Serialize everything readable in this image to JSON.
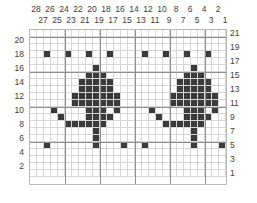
{
  "chart_data": {
    "type": "heatmap",
    "title": "",
    "xlabel": "",
    "ylabel": "",
    "columns": 28,
    "rows": 21,
    "column_labels_even": [
      28,
      26,
      24,
      22,
      20,
      18,
      16,
      14,
      12,
      10,
      8,
      6,
      4,
      2
    ],
    "column_labels_odd": [
      27,
      25,
      23,
      21,
      19,
      17,
      15,
      13,
      11,
      9,
      7,
      5,
      3,
      1
    ],
    "row_labels_left": [
      20,
      18,
      16,
      14,
      12,
      10,
      8,
      6,
      4,
      2
    ],
    "row_labels_right": [
      21,
      19,
      17,
      15,
      13,
      11,
      9,
      7,
      5,
      3,
      1
    ],
    "colors": {
      "filled": "#3b3b3b",
      "empty": "#ffffff",
      "minor_grid": "#d6d6d6",
      "major_grid": "#8e8e8e",
      "text": "#3c3c3c"
    },
    "legend": [],
    "grid": true,
    "filled_cells": [
      {
        "row": 18,
        "cols": [
          3,
          6,
          9,
          12,
          17,
          20,
          23,
          26
        ]
      },
      {
        "row": 16,
        "cols": [
          10,
          24
        ]
      },
      {
        "row": 15,
        "cols": [
          9,
          10,
          11,
          23,
          24,
          25
        ]
      },
      {
        "row": 14,
        "cols": [
          8,
          9,
          10,
          11,
          12,
          22,
          23,
          24,
          25,
          26
        ]
      },
      {
        "row": 13,
        "cols": [
          8,
          9,
          10,
          11,
          12,
          22,
          23,
          24,
          25,
          26
        ]
      },
      {
        "row": 12,
        "cols": [
          7,
          8,
          9,
          10,
          11,
          12,
          13,
          21,
          22,
          23,
          24,
          25,
          26,
          27
        ]
      },
      {
        "row": 11,
        "cols": [
          7,
          8,
          9,
          10,
          11,
          12,
          13,
          21,
          22,
          23,
          24,
          25,
          26,
          27
        ]
      },
      {
        "row": 10,
        "cols": [
          4,
          9,
          10,
          11,
          13,
          18,
          23,
          24,
          25,
          27
        ]
      },
      {
        "row": 9,
        "cols": [
          5,
          9,
          10,
          11,
          12,
          19,
          23,
          24,
          25,
          26
        ]
      },
      {
        "row": 8,
        "cols": [
          6,
          7,
          8,
          9,
          10,
          11,
          20,
          21,
          22,
          23,
          24,
          25
        ]
      },
      {
        "row": 7,
        "cols": [
          10,
          24
        ]
      },
      {
        "row": 6,
        "cols": [
          10,
          24
        ]
      },
      {
        "row": 5,
        "cols": [
          3,
          10,
          14,
          17,
          24,
          28
        ]
      }
    ]
  }
}
